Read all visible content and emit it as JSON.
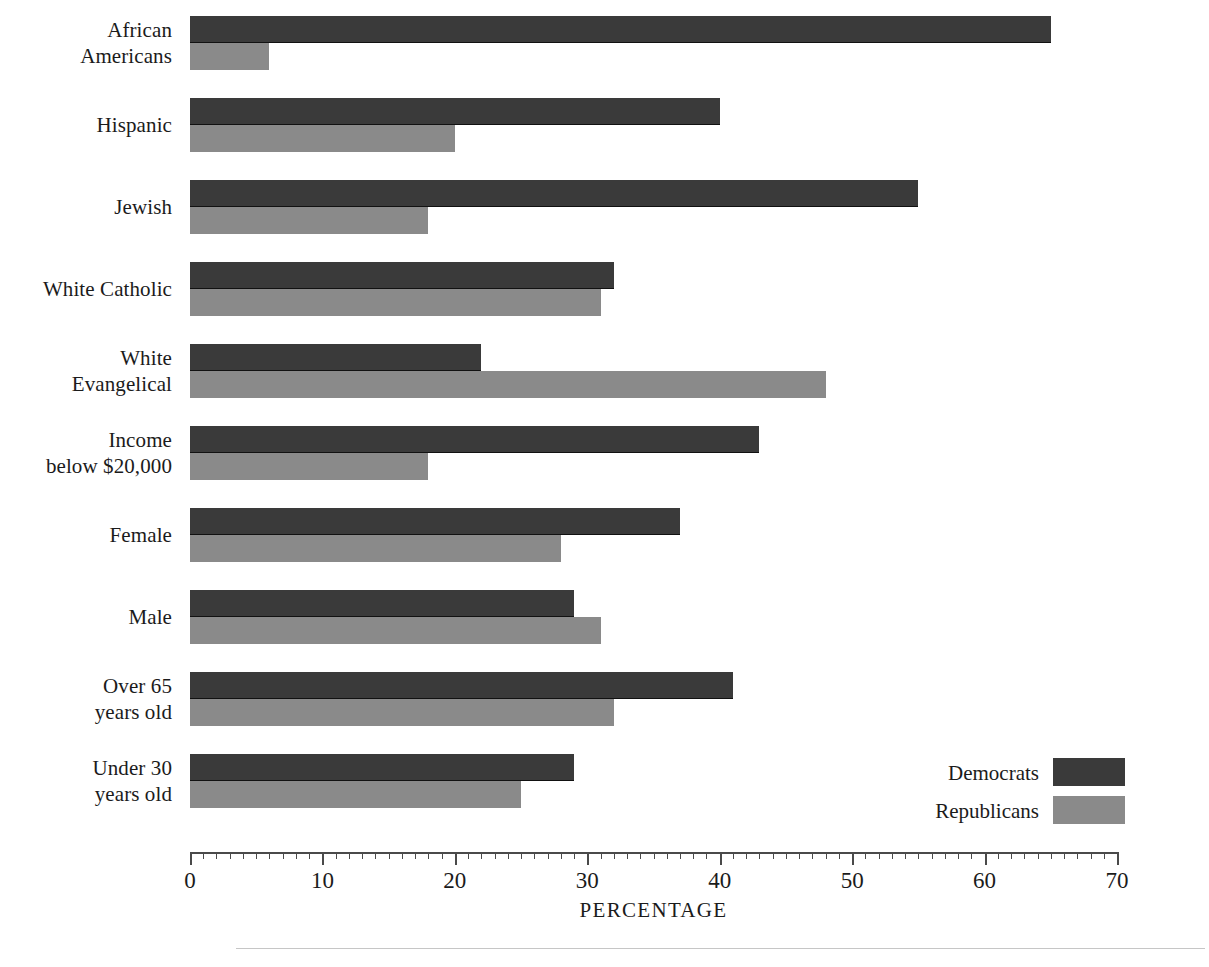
{
  "chart_data": {
    "type": "bar",
    "orientation": "horizontal",
    "title": "",
    "subtitle": "",
    "xlabel": "PERCENTAGE",
    "ylabel": "",
    "xlim": [
      0,
      70
    ],
    "grid": false,
    "legend_position": "bottom-right",
    "tick_step_major": 10,
    "tick_step_minor": 1,
    "xtick_labels": [
      "0",
      "10",
      "20",
      "30",
      "40",
      "50",
      "60",
      "70"
    ],
    "xticks": [
      0,
      10,
      20,
      30,
      40,
      50,
      60,
      70
    ],
    "categories": [
      "African Americans",
      "Hispanic",
      "Jewish",
      "White Catholic",
      "White Evangelical",
      "Income below $20,000",
      "Female",
      "Male",
      "Over 65 years old",
      "Under 30 years old"
    ],
    "category_label_lines": [
      [
        "African",
        "Americans"
      ],
      [
        "Hispanic"
      ],
      [
        "Jewish"
      ],
      [
        "White Catholic"
      ],
      [
        "White",
        "Evangelical"
      ],
      [
        "Income",
        "below $20,000"
      ],
      [
        "Female"
      ],
      [
        "Male"
      ],
      [
        "Over 65",
        "years old"
      ],
      [
        "Under 30",
        "years old"
      ]
    ],
    "series": [
      {
        "name": "Democrats",
        "color": "#3a3a3a",
        "values": [
          65,
          40,
          55,
          32,
          22,
          43,
          37,
          29,
          41,
          29
        ]
      },
      {
        "name": "Republicans",
        "color": "#8a8a8a",
        "values": [
          6,
          20,
          18,
          31,
          48,
          18,
          28,
          31,
          32,
          25
        ]
      }
    ]
  },
  "legend": {
    "items": [
      {
        "label": "Democrats",
        "color": "#3a3a3a"
      },
      {
        "label": "Republicans",
        "color": "#8a8a8a"
      }
    ]
  },
  "colors": {
    "democrat": "#3a3a3a",
    "republican": "#8a8a8a",
    "axis": "#4a4a4a",
    "text": "#1b1b1b",
    "rule": "#c6c6c6",
    "background": "#ffffff"
  }
}
